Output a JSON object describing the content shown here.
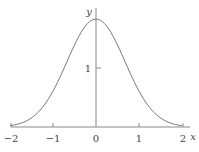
{
  "chart_data": {
    "type": "line",
    "title": "",
    "xlabel": "x",
    "ylabel": "y",
    "xlim": [
      -2,
      2
    ],
    "ylim": [
      0,
      1.9
    ],
    "xticks": [
      "-2",
      "-1",
      "0",
      "1",
      "2"
    ],
    "yticks": [
      "1"
    ],
    "grid": false,
    "legend": null,
    "series": [
      {
        "name": "bell curve",
        "x": [
          -2.0,
          -1.75,
          -1.5,
          -1.25,
          -1.0,
          -0.75,
          -0.5,
          -0.25,
          0.0,
          0.25,
          0.5,
          0.75,
          1.0,
          1.25,
          1.5,
          1.75,
          2.0
        ],
        "y": [
          0.02,
          0.06,
          0.15,
          0.33,
          0.6,
          0.97,
          1.4,
          1.72,
          1.83,
          1.72,
          1.4,
          0.97,
          0.6,
          0.33,
          0.15,
          0.06,
          0.02
        ]
      }
    ],
    "color": "#777777"
  },
  "labels": {
    "x_axis": "x",
    "y_axis": "y",
    "xtick_m2": "−2",
    "xtick_m1": "−1",
    "xtick_0": "0",
    "xtick_1": "1",
    "xtick_2": "2",
    "ytick_1": "1"
  }
}
